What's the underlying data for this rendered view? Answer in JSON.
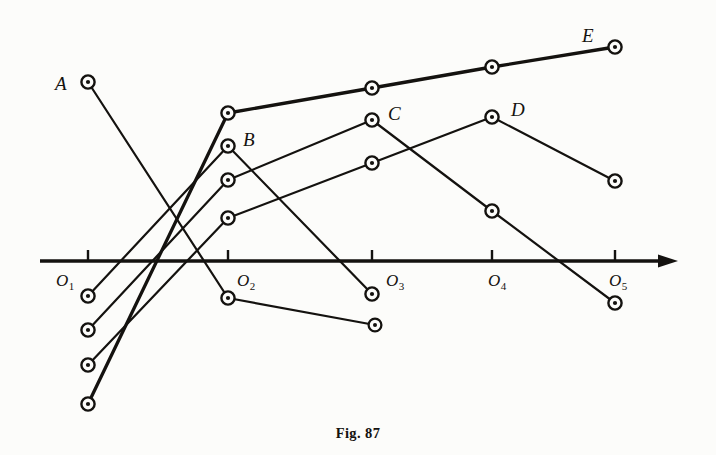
{
  "figure": {
    "caption": "Fig. 87",
    "ink_color": "#14120f",
    "background_color": "#fcfcfa"
  },
  "axis": {
    "name": "horizontal-number-axis",
    "y": 261,
    "x_start": 40,
    "x_end": 678,
    "arrow_head": true,
    "tick_length": 11,
    "ticks": [
      {
        "label": "O",
        "sub": "1",
        "x": 88,
        "label_x": 56,
        "label_y": 272
      },
      {
        "label": "O",
        "sub": "2",
        "x": 228,
        "label_x": 237,
        "label_y": 272
      },
      {
        "label": "O",
        "sub": "3",
        "x": 372,
        "label_x": 386,
        "label_y": 272
      },
      {
        "label": "O",
        "sub": "4",
        "x": 492,
        "label_x": 488,
        "label_y": 272
      },
      {
        "label": "O",
        "sub": "5",
        "x": 615,
        "label_x": 609,
        "label_y": 272
      }
    ]
  },
  "point_labels": [
    {
      "text": "A",
      "x": 55,
      "y": 74
    },
    {
      "text": "B",
      "x": 243,
      "y": 130
    },
    {
      "text": "C",
      "x": 388,
      "y": 104
    },
    {
      "text": "D",
      "x": 511,
      "y": 100
    },
    {
      "text": "E",
      "x": 582,
      "y": 26
    }
  ],
  "chart_data": {
    "type": "line",
    "title": "Fig. 87",
    "xlabel": "",
    "ylabel": "",
    "grid": false,
    "legend": "none",
    "axis_origins": [
      "O1",
      "O2",
      "O3",
      "O4",
      "O5"
    ],
    "marker": "open-circle",
    "series": [
      {
        "name": "A",
        "marker_label_at": 0,
        "points": [
          {
            "x": 88,
            "y": 82
          },
          {
            "x": 228,
            "y": 298
          }
        ]
      },
      {
        "name": "B",
        "marker_label_at": 1,
        "points": [
          {
            "x": 88,
            "y": 296
          },
          {
            "x": 228,
            "y": 146
          },
          {
            "x": 372,
            "y": 294
          }
        ]
      },
      {
        "name": "C",
        "marker_label_at": 1,
        "points": [
          {
            "x": 88,
            "y": 330
          },
          {
            "x": 228,
            "y": 180
          },
          {
            "x": 372,
            "y": 120
          },
          {
            "x": 492,
            "y": 211
          },
          {
            "x": 615,
            "y": 303
          }
        ]
      },
      {
        "name": "D",
        "marker_label_at": 2,
        "points": [
          {
            "x": 88,
            "y": 365
          },
          {
            "x": 228,
            "y": 218
          },
          {
            "x": 372,
            "y": 163
          },
          {
            "x": 492,
            "y": 117
          },
          {
            "x": 615,
            "y": 181
          }
        ]
      },
      {
        "name": "E",
        "marker_label_at": 3,
        "points": [
          {
            "x": 88,
            "y": 404
          },
          {
            "x": 228,
            "y": 113
          },
          {
            "x": 372,
            "y": 88
          },
          {
            "x": 492,
            "y": 67
          },
          {
            "x": 615,
            "y": 47
          }
        ]
      },
      {
        "name": "B-tail",
        "marker_label_at": null,
        "points": [
          {
            "x": 228,
            "y": 298
          },
          {
            "x": 375,
            "y": 325
          }
        ]
      }
    ]
  }
}
